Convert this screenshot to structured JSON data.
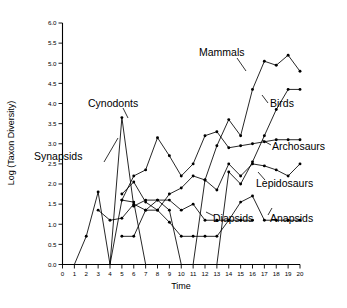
{
  "chart_data": {
    "type": "line",
    "title": "",
    "xlabel": "Time",
    "ylabel": "Log (Taxon Diversity)",
    "xlim": [
      0,
      20
    ],
    "ylim": [
      0.0,
      6.0
    ],
    "grid": false,
    "legend_position": "inline-labels",
    "x_ticks": [
      "0",
      "1",
      "2",
      "3",
      "4",
      "5",
      "6",
      "7",
      "8",
      "9",
      "10",
      "11",
      "12",
      "13",
      "14",
      "15",
      "16",
      "17",
      "18",
      "19",
      "20"
    ],
    "y_ticks": [
      "0.0",
      "0.5",
      "1.0",
      "1.5",
      "2.0",
      "2.5",
      "3.0",
      "3.5",
      "4.0",
      "4.5",
      "5.0",
      "5.5",
      "6.0"
    ],
    "x": [
      1,
      2,
      3,
      4,
      5,
      6,
      7,
      8,
      9,
      10,
      11,
      12,
      13,
      14,
      15,
      16,
      17,
      18,
      19,
      20
    ],
    "series": [
      {
        "name": "Synapsids",
        "label": "Synapsids",
        "x": [
          1,
          2,
          3,
          4,
          5,
          6,
          7
        ],
        "values": [
          0.0,
          0.7,
          1.8,
          0.0,
          1.6,
          1.55,
          0.0
        ]
      },
      {
        "name": "Cynodonts",
        "label": "Cynodonts",
        "x": [
          4,
          5,
          6,
          7,
          8,
          9,
          10,
          11
        ],
        "values": [
          0.0,
          3.65,
          1.45,
          1.6,
          1.6,
          1.35,
          0.0,
          0.0
        ]
      },
      {
        "name": "Anapsids",
        "label": "Anapsids",
        "x": [
          3,
          4,
          5,
          6,
          7,
          8,
          9,
          10,
          11,
          12,
          13,
          14,
          15,
          16,
          17,
          18,
          19,
          20
        ],
        "values": [
          1.35,
          1.1,
          1.15,
          1.5,
          1.35,
          1.6,
          1.6,
          1.35,
          1.5,
          1.1,
          1.1,
          1.1,
          1.55,
          1.7,
          1.1,
          1.1,
          1.1,
          1.1
        ]
      },
      {
        "name": "Diapsids",
        "label": "Diapsids",
        "x": [
          5,
          6,
          7,
          8,
          9,
          10,
          11,
          12,
          13,
          14,
          15,
          16
        ],
        "values": [
          0.7,
          0.7,
          1.35,
          1.35,
          1.05,
          0.7,
          0.7,
          0.7,
          0.7,
          1.1,
          1.1,
          1.1
        ]
      },
      {
        "name": "Lepidosaurs",
        "label": "Lepidosaurs",
        "x": [
          5,
          6,
          7,
          8,
          9,
          10,
          11,
          12,
          13,
          14,
          15,
          16,
          17,
          18,
          19,
          20
        ],
        "values": [
          1.75,
          2.05,
          1.55,
          1.35,
          1.75,
          1.9,
          2.2,
          2.1,
          1.85,
          2.5,
          2.2,
          2.5,
          2.45,
          2.35,
          2.2,
          2.5
        ]
      },
      {
        "name": "Archosaurs",
        "label": "Archosaurs",
        "x": [
          5,
          6,
          7,
          8,
          9,
          10,
          11,
          12,
          13,
          14,
          15,
          16,
          17,
          18,
          19,
          20
        ],
        "values": [
          1.6,
          2.2,
          2.35,
          3.15,
          2.7,
          2.2,
          2.5,
          3.2,
          3.3,
          2.9,
          2.95,
          3.0,
          3.05,
          3.1,
          3.1,
          3.1
        ]
      },
      {
        "name": "Birds",
        "label": "Birds",
        "x": [
          11,
          12,
          13,
          14,
          15,
          16,
          17,
          18,
          19,
          20
        ],
        "values": [
          0.0,
          0.0,
          0.0,
          2.3,
          2.0,
          2.55,
          3.2,
          3.85,
          4.35,
          4.35
        ]
      },
      {
        "name": "Mammals",
        "label": "Mammals",
        "x": [
          11,
          12,
          13,
          14,
          15,
          16,
          17,
          18,
          19,
          20
        ],
        "values": [
          0.0,
          2.1,
          2.95,
          3.6,
          3.2,
          4.35,
          5.05,
          4.95,
          5.2,
          4.8
        ]
      }
    ],
    "annotations": [
      {
        "text": "Mammals",
        "points_to": "mammals-series"
      },
      {
        "text": "Birds",
        "points_to": "birds-series"
      },
      {
        "text": "Archosaurs",
        "points_to": "archosaurs-series"
      },
      {
        "text": "Lepidosaurs",
        "points_to": "lepidosaurs-series"
      },
      {
        "text": "Anapsids",
        "points_to": "anapsids-series"
      },
      {
        "text": "Diapsids",
        "points_to": "diapsids-series"
      },
      {
        "text": "Cynodonts",
        "points_to": "cynodonts-series"
      },
      {
        "text": "Synapsids",
        "points_to": "synapsids-series"
      }
    ],
    "colors": {
      "line": "#000000",
      "marker": "#000000",
      "axis": "#000000",
      "background": "#ffffff"
    }
  }
}
